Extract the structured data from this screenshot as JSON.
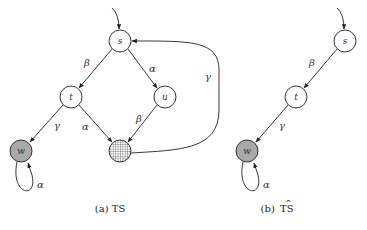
{
  "panels": [
    {
      "id": "a",
      "caption": "(a) TS",
      "nodes": [
        {
          "id": "s",
          "label": "s",
          "x": 120,
          "y": 41,
          "fill": "white"
        },
        {
          "id": "t",
          "label": "t",
          "x": 71,
          "y": 97,
          "fill": "white"
        },
        {
          "id": "u",
          "label": "u",
          "x": 165,
          "y": 97,
          "fill": "white"
        },
        {
          "id": "w",
          "label": "w",
          "x": 21,
          "y": 151,
          "fill": "gray"
        },
        {
          "id": "x",
          "label": "",
          "x": 120,
          "y": 151,
          "fill": "dotted"
        }
      ],
      "edges": [
        {
          "from": "init",
          "to": "s",
          "label": ""
        },
        {
          "from": "s",
          "to": "t",
          "label": "β"
        },
        {
          "from": "s",
          "to": "u",
          "label": "α"
        },
        {
          "from": "t",
          "to": "w",
          "label": "γ"
        },
        {
          "from": "t",
          "to": "x",
          "label": "α"
        },
        {
          "from": "u",
          "to": "x",
          "label": "β"
        },
        {
          "from": "x",
          "to": "s",
          "label": "γ"
        },
        {
          "from": "w",
          "to": "w",
          "label": "α"
        }
      ]
    },
    {
      "id": "b",
      "caption_prefix": "(b) ",
      "caption_main": "TS",
      "caption_hat": "^",
      "nodes": [
        {
          "id": "s",
          "label": "s",
          "x": 345,
          "y": 41,
          "fill": "white"
        },
        {
          "id": "t",
          "label": "t",
          "x": 296,
          "y": 97,
          "fill": "white"
        },
        {
          "id": "w",
          "label": "w",
          "x": 247,
          "y": 151,
          "fill": "gray"
        }
      ],
      "edges": [
        {
          "from": "init",
          "to": "s",
          "label": ""
        },
        {
          "from": "s",
          "to": "t",
          "label": "β"
        },
        {
          "from": "t",
          "to": "w",
          "label": "γ"
        },
        {
          "from": "w",
          "to": "w",
          "label": "α"
        }
      ]
    }
  ],
  "labels": {
    "a_s": "s",
    "a_t": "t",
    "a_u": "u",
    "a_w": "w",
    "a_e_st": "β",
    "a_e_su": "α",
    "a_e_tw": "γ",
    "a_e_tx": "α",
    "a_e_ux": "β",
    "a_e_xs": "γ",
    "a_e_ww": "α",
    "b_s": "s",
    "b_t": "t",
    "b_w": "w",
    "b_e_st": "β",
    "b_e_tw": "γ",
    "b_e_ww": "α",
    "caption_a": "(a) TS",
    "caption_b_prefix": "(b) ",
    "caption_b_main": "TS",
    "caption_b_hat": "^"
  }
}
